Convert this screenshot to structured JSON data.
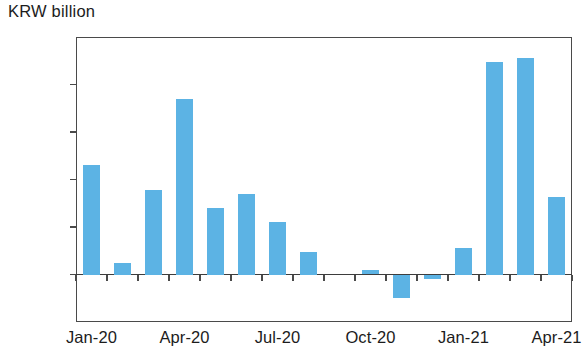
{
  "chart_data": {
    "type": "bar",
    "title": "",
    "subtitle": "",
    "unit_label": "KRW billion",
    "xlabel": "",
    "ylabel": "KRW billion",
    "ylim": [
      -2000,
      10000
    ],
    "y_ticks": [
      -2000,
      0,
      2000,
      4000,
      6000,
      8000,
      10000
    ],
    "y_tick_labels": [
      "-2,000",
      "0",
      "2,000",
      "4,000",
      "6,000",
      "8,000",
      "10,000"
    ],
    "grid": false,
    "legend": null,
    "bar_color": "#5cb3e4",
    "axis_color": "#4a4a4a",
    "categories": [
      "Jan-20",
      "Feb-20",
      "Mar-20",
      "Apr-20",
      "May-20",
      "Jun-20",
      "Jul-20",
      "Aug-20",
      "Sep-20",
      "Oct-20",
      "Nov-20",
      "Dec-20",
      "Jan-21",
      "Feb-21",
      "Mar-21",
      "Apr-21"
    ],
    "values": [
      4600,
      500,
      3550,
      7400,
      2800,
      3400,
      2200,
      950,
      0,
      180,
      -1000,
      -200,
      1100,
      8950,
      9100,
      3250
    ],
    "x_tick_labels": [
      "Jan-20",
      "Apr-20",
      "Jul-20",
      "Oct-20",
      "Jan-21",
      "Apr-21"
    ],
    "x_tick_indices": [
      0,
      3,
      6,
      9,
      12,
      15
    ]
  }
}
